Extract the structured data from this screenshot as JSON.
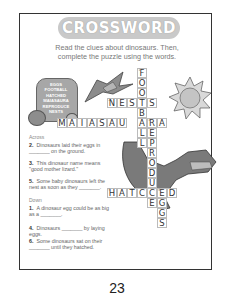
{
  "title": "CROSSWORD",
  "instructions": [
    "Read the clues about dinosaurs. Then,",
    "complete the puzzle using the words."
  ],
  "word_bank": [
    "EGGS",
    "FOOTBALL",
    "HATCHED",
    "MAIASAURA",
    "REPRODUCE",
    "NESTS"
  ],
  "across_label": "Across",
  "down_label": "Down",
  "across": [
    {
      "num": "2.",
      "text": "Dinosaurs laid their eggs in _______ on the ground."
    },
    {
      "num": "3.",
      "text": "This dinosaur name means \"good mother lizard.\""
    },
    {
      "num": "5.",
      "text": "Some baby dinosaurs left the nest as soon as they _______."
    }
  ],
  "down": [
    {
      "num": "1.",
      "text": "A dinosaur egg could be as big as a _______."
    },
    {
      "num": "4.",
      "text": "Dinosaurs _______ by laying eggs."
    },
    {
      "num": "6.",
      "text": "Some dinosaurs sat on their _______ until they hatched."
    }
  ],
  "grid": {
    "football": [
      "F",
      "O",
      "O",
      "T",
      "B",
      "A",
      "L",
      "L"
    ],
    "nests": [
      "N",
      "E",
      "S",
      "T",
      "S"
    ],
    "maiasaura": [
      "M",
      "A",
      "I",
      "A",
      "S",
      "A",
      "U",
      "R",
      "A"
    ],
    "reproduce": [
      "R",
      "E",
      "P",
      "R",
      "O",
      "D",
      "U",
      "C",
      "E"
    ],
    "hatched": [
      "H",
      "A",
      "T",
      "C",
      "H",
      "E",
      "D"
    ],
    "eggs": [
      "E",
      "G",
      "G",
      "S"
    ]
  },
  "page_number": "23",
  "colors": {
    "border": "#333333",
    "title_bg": "#c9c9c9",
    "text": "#555555"
  }
}
